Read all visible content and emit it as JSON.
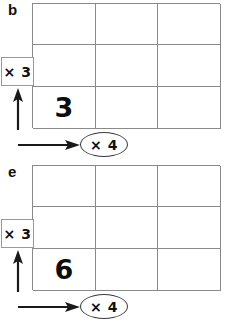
{
  "figure": {
    "background_color": "#ffffff",
    "grid_line_color": "#8a8a8a",
    "text_color": "#111111"
  },
  "panels": [
    {
      "label": "b",
      "row_multiplier": {
        "text": "× 3",
        "shape": "rectangle",
        "arrow": "up-arrow-icon"
      },
      "column_multiplier": {
        "text": "× 4",
        "shape": "ellipse",
        "arrow": "right-arrow-icon"
      },
      "grid": {
        "rows": 3,
        "columns": 3,
        "cells": [
          [
            "",
            "",
            ""
          ],
          [
            "",
            "",
            ""
          ],
          [
            "3",
            "",
            ""
          ]
        ]
      }
    },
    {
      "label": "e",
      "row_multiplier": {
        "text": "× 3",
        "shape": "rectangle",
        "arrow": "up-arrow-icon"
      },
      "column_multiplier": {
        "text": "× 4",
        "shape": "ellipse",
        "arrow": "right-arrow-icon"
      },
      "grid": {
        "rows": 3,
        "columns": 3,
        "cells": [
          [
            "",
            "",
            ""
          ],
          [
            "",
            "",
            ""
          ],
          [
            "6",
            "",
            ""
          ]
        ]
      }
    }
  ]
}
